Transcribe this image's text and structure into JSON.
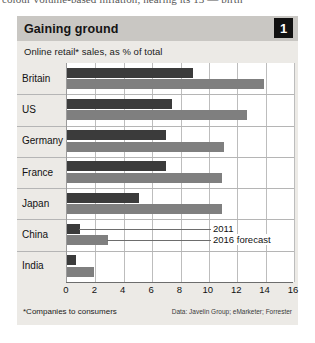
{
  "article_bleed_text": "colour  volume-based inflation, nearing its 13 — birth",
  "figure": {
    "badge": "1",
    "title": "Gaining ground",
    "subtitle": "Online retail* sales, as % of total",
    "footnote": "*Companies to consumers",
    "source": "Data: Javelin Group; eMarketer; Forrester"
  },
  "legend": {
    "series_2011_label": "2011",
    "series_2016_label": "2016 forecast",
    "color_2011": "#3b3b3b",
    "color_2016": "#7f7f7f"
  },
  "chart_data": {
    "type": "bar",
    "orientation": "horizontal",
    "title": "Gaining ground",
    "subtitle": "Online retail* sales, as % of total",
    "xlabel": "",
    "ylabel": "",
    "xlim": [
      0,
      16
    ],
    "xticks": [
      0,
      2,
      4,
      6,
      8,
      10,
      12,
      14,
      16
    ],
    "grid": true,
    "legend_position": "inside-right",
    "categories": [
      "Britain",
      "US",
      "Germany",
      "France",
      "Japan",
      "China",
      "India"
    ],
    "series": [
      {
        "name": "2011",
        "color": "#3b3b3b",
        "values": [
          8.9,
          7.4,
          7.0,
          7.0,
          5.1,
          0.9,
          0.6
        ]
      },
      {
        "name": "2016 forecast",
        "color": "#7f7f7f",
        "values": [
          13.9,
          12.7,
          11.1,
          10.9,
          10.9,
          2.9,
          1.9
        ]
      }
    ],
    "footnote": "*Companies to consumers",
    "source": "Data: Javelin Group; eMarketer; Forrester"
  }
}
